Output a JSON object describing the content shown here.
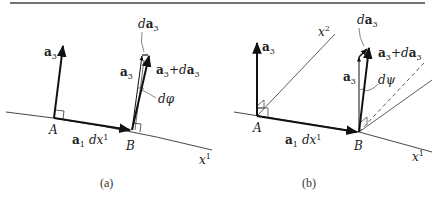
{
  "figure": {
    "top_rule": true,
    "panels": [
      {
        "id": "a",
        "caption": "(a)",
        "points": {
          "A": "A",
          "B": "B"
        },
        "labels": {
          "a3_at_A_bold": "a",
          "a3_at_A_sub": "3",
          "a3_at_B_bold": "a",
          "a3_at_B_sub": "3",
          "da3_d": "d",
          "da3_bold": "a",
          "da3_sub": "3",
          "sum_a": "a",
          "sum_sub1": "3",
          "sum_plus": "+",
          "sum_d": "d",
          "sum_a2": "a",
          "sum_sub2": "3",
          "angle": "dφ",
          "a1dx1_bold": "a",
          "a1dx1_sub": "1",
          "a1dx1_dx": "dx",
          "a1dx1_sup": "1",
          "axis_x": "x",
          "axis_sup": "1"
        }
      },
      {
        "id": "b",
        "caption": "(b)",
        "points": {
          "A": "A",
          "B": "B"
        },
        "labels": {
          "a3_at_A_bold": "a",
          "a3_at_A_sub": "3",
          "a3_at_B_bold": "a",
          "a3_at_B_sub": "3",
          "da3_d": "d",
          "da3_bold": "a",
          "da3_sub": "3",
          "sum_a": "a",
          "sum_sub1": "3",
          "sum_plus": "+",
          "sum_d": "d",
          "sum_a2": "a",
          "sum_sub2": "3",
          "angle": "dψ",
          "a1dx1_bold": "a",
          "a1dx1_sub": "1",
          "a1dx1_dx": "dx",
          "a1dx1_sup": "1",
          "axis1_x": "x",
          "axis1_sup": "1",
          "axis2_x": "x",
          "axis2_sup": "2"
        }
      }
    ]
  }
}
